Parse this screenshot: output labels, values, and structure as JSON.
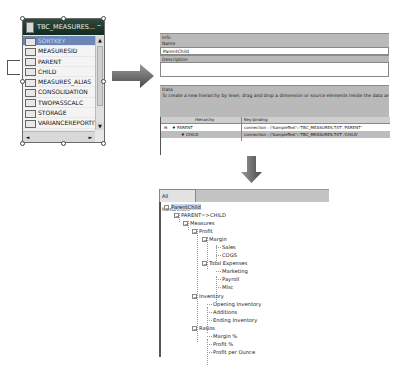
{
  "table_widget": {
    "title": "TBC_MEASURES...",
    "minimize_glyph": "–",
    "columns": [
      {
        "name": "SORTKEY",
        "selected": true
      },
      {
        "name": "MEASURESID",
        "selected": false
      },
      {
        "name": "PARENT",
        "selected": false
      },
      {
        "name": "CHILD",
        "selected": false
      },
      {
        "name": "MEASURES_ALIAS",
        "selected": false
      },
      {
        "name": "CONSOLIDATION",
        "selected": false
      },
      {
        "name": "TWOPASSCALC",
        "selected": false
      },
      {
        "name": "STORAGE",
        "selected": false
      },
      {
        "name": "VARIANCEREPORTIT",
        "selected": false
      },
      {
        "name": "TIMEBALANCE",
        "selected": false
      }
    ],
    "scroll_up": "▲",
    "scroll_down": "▼",
    "scroll_left": "◄",
    "scroll_right": "►"
  },
  "info_panel": {
    "section_info": "Info",
    "name_label": "Name",
    "name_value": "ParentChild",
    "description_label": "Description",
    "description_value": "",
    "section_data": "Data",
    "instructions": "To create a new hierarchy by level, drag and drop a dimension or source elements inside the data area or click the Add b",
    "grid": {
      "headers": [
        "Hierarchy",
        "Key binding"
      ],
      "rows": [
        {
          "hierarchy": "PARENT",
          "binding": "connection : ('SampleText'::'TBC_MEASURES.TXT'.'PARENT'",
          "expand": "⊟"
        },
        {
          "hierarchy": "CHILD",
          "binding": "connection : ('SampleText'::'TBC_MEASURES.TXT'.'CHILD'",
          "expand": ""
        }
      ]
    }
  },
  "hierarchy_tree": {
    "tab_label": "All hierarchies",
    "nodes": [
      {
        "label": "ParentChild",
        "level": 0,
        "expanded": true,
        "highlighted": true
      },
      {
        "label": "PARENT=>CHILD",
        "level": 1,
        "expanded": true
      },
      {
        "label": "Measures",
        "level": 2,
        "expanded": true
      },
      {
        "label": "Profit",
        "level": 3,
        "expanded": true
      },
      {
        "label": "Margin",
        "level": 4,
        "expanded": true
      },
      {
        "label": "Sales",
        "level": 5,
        "leaf": true
      },
      {
        "label": "COGS",
        "level": 5,
        "leaf": true
      },
      {
        "label": "Total Expenses",
        "level": 4,
        "expanded": true
      },
      {
        "label": "Marketing",
        "level": 5,
        "leaf": true
      },
      {
        "label": "Payroll",
        "level": 5,
        "leaf": true
      },
      {
        "label": "Misc",
        "level": 5,
        "leaf": true
      },
      {
        "label": "Inventory",
        "level": 3,
        "expanded": true
      },
      {
        "label": "Opening Inventory",
        "level": 4,
        "leaf": true
      },
      {
        "label": "Additions",
        "level": 4,
        "leaf": true
      },
      {
        "label": "Ending Inventory",
        "level": 4,
        "leaf": true
      },
      {
        "label": "Ratios",
        "level": 3,
        "expanded": true
      },
      {
        "label": "Margin %",
        "level": 4,
        "leaf": true
      },
      {
        "label": "Profit %",
        "level": 4,
        "leaf": true
      },
      {
        "label": "Profit per Ounce",
        "level": 4,
        "leaf": true
      }
    ]
  },
  "colors": {
    "title_bar": "#1c3529",
    "selected_row": "#6c86b7",
    "panel_bar": "#b9b9b9",
    "arrow": "#666666"
  }
}
